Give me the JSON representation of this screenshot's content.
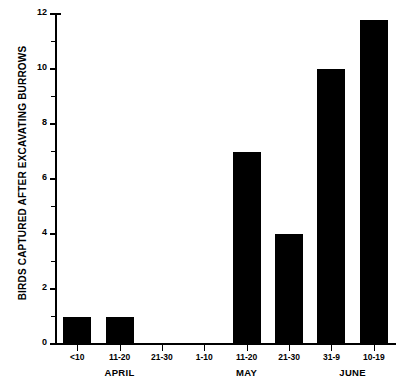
{
  "chart_data": {
    "type": "bar",
    "title": "",
    "xlabel": "",
    "ylabel": "BIRDS CAPTURED AFTER EXCAVATING BURROWS",
    "categories": [
      "<10",
      "11-20",
      "21-30",
      "1-10",
      "11-20",
      "21-30",
      "31-9",
      "10-19"
    ],
    "values": [
      1,
      1,
      0,
      0,
      7,
      4,
      10,
      11.8
    ],
    "ylim": [
      0,
      12
    ],
    "ytick_labels": [
      "0",
      "2",
      "4",
      "6",
      "8",
      "10",
      "12"
    ],
    "ytick_values": [
      0,
      2,
      4,
      6,
      8,
      10,
      12
    ],
    "yminor_values": [
      1,
      3,
      5,
      7,
      9,
      11
    ],
    "grid": "off",
    "legend": "none",
    "bar_color": "#000000",
    "background_color": "#ffffff",
    "groups": [
      {
        "label": "APRIL",
        "start_index": 0,
        "end_index": 2
      },
      {
        "label": "MAY",
        "start_index": 3,
        "end_index": 5
      },
      {
        "label": "JUNE",
        "start_index": 6,
        "end_index": 7
      }
    ]
  },
  "axis": {
    "ylabel_text": "BIRDS CAPTURED AFTER EXCAVATING BURROWS"
  }
}
